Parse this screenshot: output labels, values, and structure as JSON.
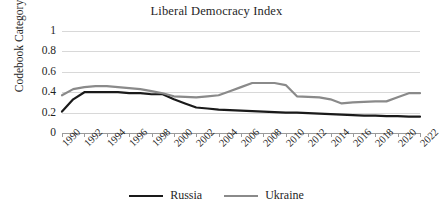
{
  "chart_data": {
    "type": "line",
    "title": "Liberal Democracy Index",
    "xlabel": "",
    "ylabel": "Codebook Category",
    "ylim": [
      0,
      1
    ],
    "yticks": [
      "0",
      "0.2",
      "0.4",
      "0.6",
      "0.8",
      "1"
    ],
    "ytick_values": [
      0,
      0.2,
      0.4,
      0.6,
      0.8,
      1
    ],
    "xlim": [
      1990,
      2022
    ],
    "xtick_labels": [
      "1990",
      "1992",
      "1994",
      "1996",
      "1998",
      "2000",
      "2002",
      "2004",
      "2006",
      "2008",
      "2010",
      "2012",
      "2014",
      "2016",
      "2018",
      "2020",
      "2022"
    ],
    "xtick_values": [
      1990,
      1992,
      1994,
      1996,
      1998,
      2000,
      2002,
      2004,
      2006,
      2008,
      2010,
      2012,
      2014,
      2016,
      2018,
      2020,
      2022
    ],
    "grid": true,
    "legend_position": "bottom",
    "x": [
      1990,
      1991,
      1992,
      1993,
      1994,
      1995,
      1996,
      1997,
      1998,
      1999,
      2000,
      2001,
      2002,
      2003,
      2004,
      2005,
      2006,
      2007,
      2008,
      2009,
      2010,
      2011,
      2012,
      2013,
      2014,
      2015,
      2016,
      2017,
      2018,
      2019,
      2020,
      2021,
      2022
    ],
    "series": [
      {
        "name": "Russia",
        "color": "#1a1a1a",
        "linewidth": 2.2,
        "values": [
          0.21,
          0.33,
          0.4,
          0.4,
          0.4,
          0.4,
          0.39,
          0.39,
          0.38,
          0.38,
          0.33,
          0.29,
          0.25,
          0.24,
          0.23,
          0.225,
          0.22,
          0.215,
          0.21,
          0.205,
          0.2,
          0.2,
          0.195,
          0.19,
          0.185,
          0.18,
          0.175,
          0.17,
          0.17,
          0.165,
          0.165,
          0.16,
          0.16
        ]
      },
      {
        "name": "Ukraine",
        "color": "#8a8a8a",
        "linewidth": 2.2,
        "values": [
          0.37,
          0.43,
          0.45,
          0.46,
          0.46,
          0.45,
          0.44,
          0.43,
          0.41,
          0.39,
          0.36,
          0.355,
          0.35,
          0.36,
          0.37,
          0.41,
          0.45,
          0.49,
          0.49,
          0.49,
          0.47,
          0.36,
          0.355,
          0.35,
          0.33,
          0.29,
          0.3,
          0.305,
          0.31,
          0.31,
          0.35,
          0.39,
          0.39
        ]
      }
    ]
  },
  "legend": {
    "items": [
      {
        "label": "Russia",
        "color": "#1a1a1a"
      },
      {
        "label": "Ukraine",
        "color": "#8a8a8a"
      }
    ]
  }
}
